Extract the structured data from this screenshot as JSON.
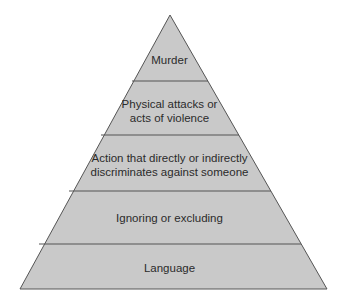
{
  "diagram": {
    "type": "pyramid",
    "colors": {
      "fill": "#c9c9c9",
      "stroke": "#555555",
      "text": "#2b2b2b",
      "background": "#ffffff"
    },
    "tiers": [
      {
        "label": "Murder",
        "order": 1
      },
      {
        "label": "Physical attacks or\nacts of violence",
        "order": 2
      },
      {
        "label": "Action that directly or indirectly\ndiscriminates against someone",
        "order": 3
      },
      {
        "label": "Ignoring or excluding",
        "order": 4
      },
      {
        "label": "Language",
        "order": 5
      }
    ]
  }
}
